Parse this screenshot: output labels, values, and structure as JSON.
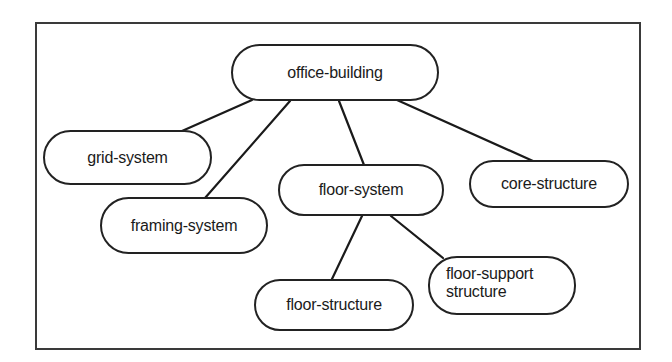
{
  "diagram": {
    "type": "tree",
    "root": "office-building",
    "nodes": [
      {
        "id": "office-building",
        "label": "office-building"
      },
      {
        "id": "grid-system",
        "label": "grid-system"
      },
      {
        "id": "framing-system",
        "label": "framing-system"
      },
      {
        "id": "floor-system",
        "label": "floor-system"
      },
      {
        "id": "core-structure",
        "label": "core-structure"
      },
      {
        "id": "floor-structure",
        "label": "floor-structure"
      },
      {
        "id": "floor-support-structure",
        "label_line1": "floor-support",
        "label_line2": "structure"
      }
    ],
    "edges": [
      {
        "from": "office-building",
        "to": "grid-system"
      },
      {
        "from": "office-building",
        "to": "framing-system"
      },
      {
        "from": "office-building",
        "to": "floor-system"
      },
      {
        "from": "office-building",
        "to": "core-structure"
      },
      {
        "from": "floor-system",
        "to": "floor-structure"
      },
      {
        "from": "floor-system",
        "to": "floor-support-structure"
      }
    ]
  }
}
